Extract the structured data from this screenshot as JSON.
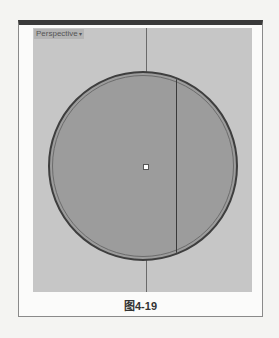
{
  "viewport": {
    "label": "Perspective",
    "dropdown_icon": "chevron-down-icon"
  },
  "caption": "图4-19",
  "colors": {
    "viewport_bg": "#c6c6c6",
    "circle_fill": "#9c9c9c",
    "circle_edge": "#3e3e3e",
    "frame_top_bar": "#3a3a3a"
  }
}
